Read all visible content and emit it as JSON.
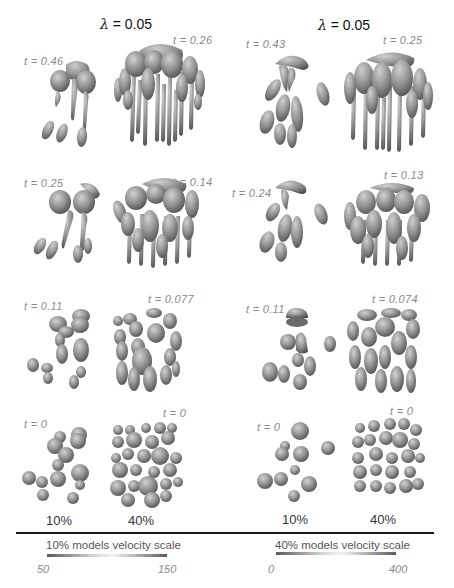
{
  "figure": {
    "columns": [
      {
        "header": "λ = 0.05",
        "lambda_symbol": "λ",
        "lambda_value": "= 0.05",
        "rows": [
          {
            "t_10": "t = 0.46",
            "t_40": "t = 0.26"
          },
          {
            "t_10": "t = 0.25",
            "t_40": "t = 0.14"
          },
          {
            "t_10": "t = 0.11",
            "t_40": "t = 0.077"
          },
          {
            "t_10": "t = 0",
            "t_40": "t = 0"
          }
        ],
        "bottom_labels": {
          "left": "10%",
          "right": "40%"
        }
      },
      {
        "header": "λ = 0.05",
        "lambda_symbol": "λ",
        "lambda_value": "= 0.05",
        "rows": [
          {
            "t_10": "t = 0.43",
            "t_40": "t = 0.25"
          },
          {
            "t_10": "t = 0.24",
            "t_40": "t = 0.13"
          },
          {
            "t_10": "t = 0.11",
            "t_40": "t = 0.074"
          },
          {
            "t_10": "t = 0",
            "t_40": "t = 0"
          }
        ],
        "bottom_labels": {
          "left": "10%",
          "right": "40%"
        }
      }
    ],
    "velocity_scales": [
      {
        "title": "10% models velocity scale",
        "min": "50",
        "max": "150"
      },
      {
        "title": "40% models velocity scale",
        "min": "0",
        "max": "400"
      }
    ],
    "colors": {
      "particle_base": "#8c8c8c",
      "particle_highlight": "#c8c8c8",
      "particle_shadow": "#4a4a4a",
      "label_gray": "#8a8a8a",
      "rule": "#1a1a1a"
    }
  }
}
